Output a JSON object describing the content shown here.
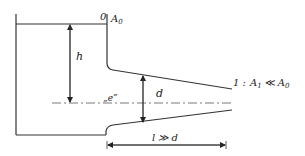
{
  "diagram": {
    "type": "fluid-mechanics-tank-with-nozzle",
    "labels": {
      "station0": "0",
      "area0": "A",
      "area0_sub": "0",
      "height": "h",
      "entry_point": "„e”",
      "diameter": "d",
      "outlet_station": "1 :",
      "outlet_area": "A",
      "outlet_area_sub": "1",
      "outlet_relation": "≪",
      "outlet_ref": "A",
      "outlet_ref_sub": "0",
      "length": "l ≫ d"
    },
    "colors": {
      "stroke": "#333333",
      "centerline": "#555555",
      "background": "#ffffff"
    }
  }
}
